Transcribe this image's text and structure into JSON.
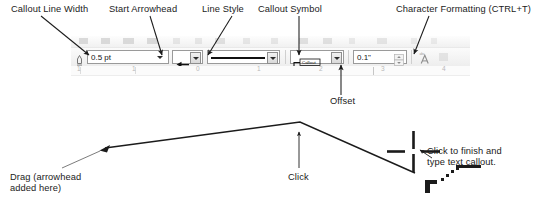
{
  "annotations": {
    "callout_line_width": "Callout Line Width",
    "start_arrowhead": "Start Arrowhead",
    "line_style": "Line Style",
    "callout_symbol": "Callout Symbol",
    "character_formatting": "Character Formatting (CTRL+T)",
    "offset": "Offset",
    "drag": "Drag (arrowhead\nadded here)",
    "click": "Click",
    "click_to_finish": "Click to finish and\ntype text callout."
  },
  "toolbar": {
    "line_width_value": "0.5 pt",
    "offset_value": "0.1\"",
    "callout_symbol_value": "Callout",
    "icons": {
      "line_width": "pen-width-icon",
      "arrowhead": "left-arrowhead-icon",
      "line_style": "solid-line-icon",
      "callout_symbol": "callout-symbol-icon",
      "character_formatting": "character-formatting-icon",
      "spinner": "spinner-icon",
      "dropdown": "chevron-down-icon"
    }
  },
  "ruler": {
    "labels": [
      "1",
      "0",
      "1",
      "2",
      "3",
      "4"
    ]
  },
  "canvas": {
    "cursor": "crosshair-cursor",
    "callout_cursor_glyph": "callout-cursor-icon"
  },
  "colors": {
    "ink": "#1b1b1b",
    "leader": "#2b2b2b",
    "toolbar_bg": "#efefef",
    "field_bg": "#ffffff",
    "ruler_text": "#b9b9b9"
  }
}
